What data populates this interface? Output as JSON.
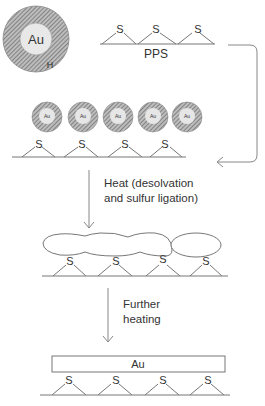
{
  "diagram": {
    "nanoparticle": {
      "core_label": "Au",
      "shell_label": "H"
    },
    "polymer": {
      "label": "PPS",
      "sulfur_label": "S"
    },
    "stage1": {
      "particle_label": "Au",
      "shell_label": "H",
      "sulfur_label": "S",
      "particle_count": 5
    },
    "step1": {
      "line1": "Heat (desolvation",
      "line2": "and sulfur ligation)"
    },
    "stage2": {
      "sulfur_label": "S"
    },
    "step2": {
      "line1": "Further",
      "line2": "heating"
    },
    "stage3": {
      "film_label": "Au",
      "sulfur_label": "S"
    },
    "colors": {
      "line": "#777777",
      "shell_fill": "#9a9a9a",
      "core_fill": "#e6e6e6",
      "text": "#333333"
    }
  }
}
